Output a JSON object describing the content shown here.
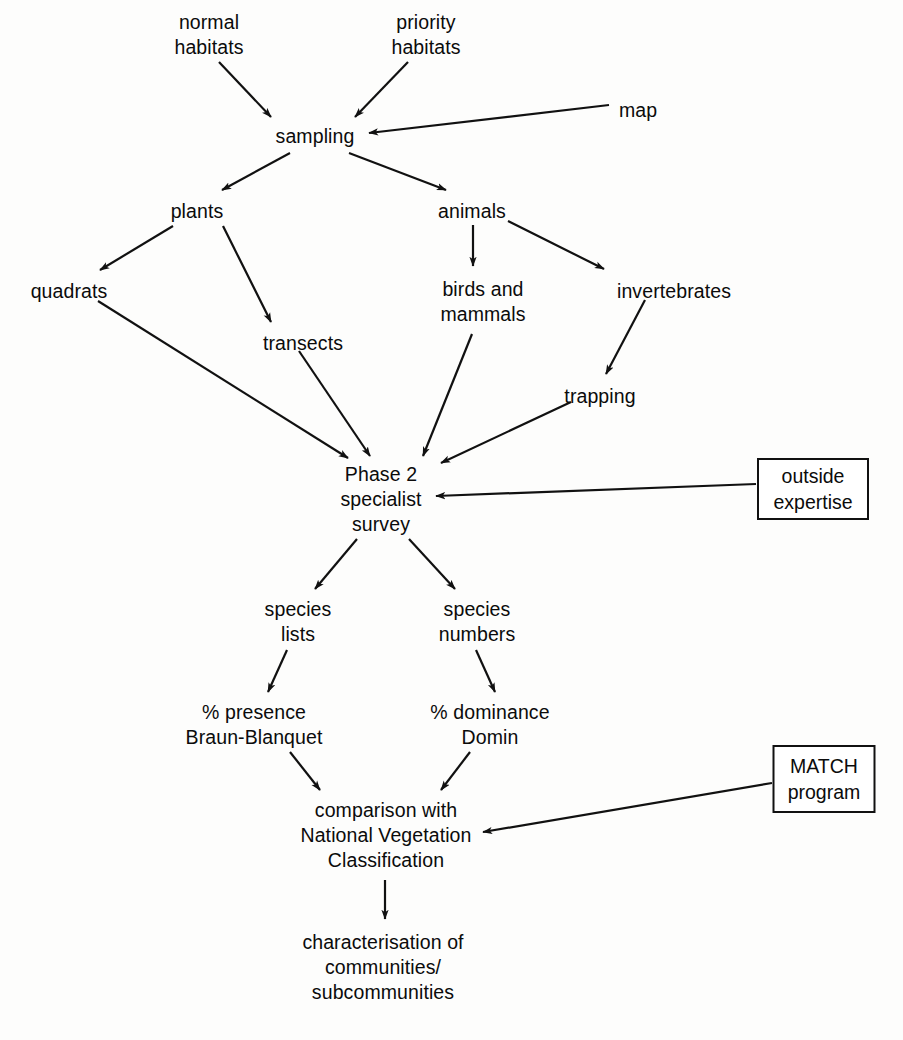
{
  "diagram": {
    "type": "flowchart",
    "background_color": "#fdfdfc",
    "line_color": "#111111",
    "text_color": "#0b0b0b",
    "nodes": [
      {
        "id": "normal_habitats",
        "label": "normal\nhabitats",
        "shape": "text",
        "x": 209,
        "y": 10
      },
      {
        "id": "priority_habitats",
        "label": "priority\nhabitats",
        "shape": "text",
        "x": 426,
        "y": 10
      },
      {
        "id": "map",
        "label": "map",
        "shape": "text",
        "x": 638,
        "y": 98
      },
      {
        "id": "sampling",
        "label": "sampling",
        "shape": "text",
        "x": 315,
        "y": 124
      },
      {
        "id": "plants",
        "label": "plants",
        "shape": "text",
        "x": 197,
        "y": 199
      },
      {
        "id": "animals",
        "label": "animals",
        "shape": "text",
        "x": 472,
        "y": 199
      },
      {
        "id": "quadrats",
        "label": "quadrats",
        "shape": "text",
        "x": 69,
        "y": 279
      },
      {
        "id": "transects",
        "label": "transects",
        "shape": "text",
        "x": 303,
        "y": 331
      },
      {
        "id": "birds_mammals",
        "label": "birds and\nmammals",
        "shape": "text",
        "x": 483,
        "y": 277
      },
      {
        "id": "invertebrates",
        "label": "invertebrates",
        "shape": "text",
        "x": 674,
        "y": 279
      },
      {
        "id": "trapping",
        "label": "trapping",
        "shape": "text",
        "x": 600,
        "y": 384
      },
      {
        "id": "phase2",
        "label": "Phase 2\nspecialist\nsurvey",
        "shape": "text",
        "x": 381,
        "y": 462
      },
      {
        "id": "outside_expertise",
        "label": "outside\nexpertise",
        "shape": "box",
        "x": 813,
        "y": 458,
        "width": 112,
        "height": 62
      },
      {
        "id": "species_lists",
        "label": "species\nlists",
        "shape": "text",
        "x": 298,
        "y": 597
      },
      {
        "id": "species_numbers",
        "label": "species\nnumbers",
        "shape": "text",
        "x": 477,
        "y": 597
      },
      {
        "id": "percent_presence",
        "label": "% presence\nBraun-Blanquet",
        "shape": "text",
        "x": 254,
        "y": 700
      },
      {
        "id": "percent_dominance",
        "label": "% dominance\nDomin",
        "shape": "text",
        "x": 490,
        "y": 700
      },
      {
        "id": "comparison_nvc",
        "label": "comparison with\nNational Vegetation\nClassification",
        "shape": "text",
        "x": 386,
        "y": 798
      },
      {
        "id": "match_program",
        "label": "MATCH\nprogram",
        "shape": "box",
        "x": 824,
        "y": 745,
        "width": 103,
        "height": 68
      },
      {
        "id": "characterisation",
        "label": "characterisation of\ncommunities/\nsubcommunities",
        "shape": "text",
        "x": 383,
        "y": 930
      }
    ],
    "edges": [
      {
        "from": "normal_habitats",
        "to": "sampling",
        "arrow": true
      },
      {
        "from": "priority_habitats",
        "to": "sampling",
        "arrow": true
      },
      {
        "from": "map",
        "to": "sampling",
        "arrow": true
      },
      {
        "from": "sampling",
        "to": "plants",
        "arrow": true
      },
      {
        "from": "sampling",
        "to": "animals",
        "arrow": true
      },
      {
        "from": "plants",
        "to": "quadrats",
        "arrow": true
      },
      {
        "from": "plants",
        "to": "transects",
        "arrow": true
      },
      {
        "from": "animals",
        "to": "birds_mammals",
        "arrow": true
      },
      {
        "from": "animals",
        "to": "invertebrates",
        "arrow": true
      },
      {
        "from": "invertebrates",
        "to": "trapping",
        "arrow": true
      },
      {
        "from": "quadrats",
        "to": "phase2",
        "arrow": true
      },
      {
        "from": "transects",
        "to": "phase2",
        "arrow": true
      },
      {
        "from": "birds_mammals",
        "to": "phase2",
        "arrow": true
      },
      {
        "from": "trapping",
        "to": "phase2",
        "arrow": true
      },
      {
        "from": "outside_expertise",
        "to": "phase2",
        "arrow": true
      },
      {
        "from": "phase2",
        "to": "species_lists",
        "arrow": true
      },
      {
        "from": "phase2",
        "to": "species_numbers",
        "arrow": true
      },
      {
        "from": "species_lists",
        "to": "percent_presence",
        "arrow": true
      },
      {
        "from": "species_numbers",
        "to": "percent_dominance",
        "arrow": true
      },
      {
        "from": "percent_presence",
        "to": "comparison_nvc",
        "arrow": true
      },
      {
        "from": "percent_dominance",
        "to": "comparison_nvc",
        "arrow": true
      },
      {
        "from": "match_program",
        "to": "comparison_nvc",
        "arrow": true
      },
      {
        "from": "comparison_nvc",
        "to": "characterisation",
        "arrow": true
      }
    ]
  }
}
